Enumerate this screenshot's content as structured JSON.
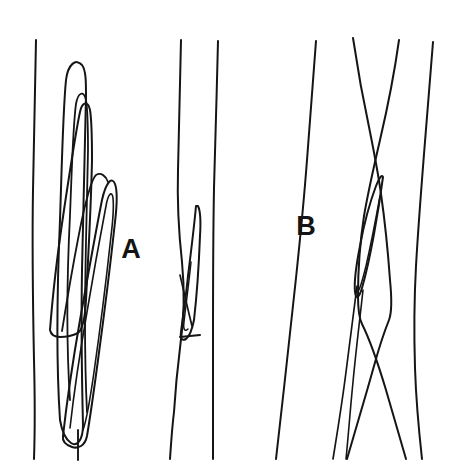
{
  "figure": {
    "background_color": "#ffffff",
    "ink_color": "#151515",
    "width": 465,
    "height": 476,
    "labels": [
      {
        "id": "label-a",
        "text": "A",
        "x": 131,
        "y": 258,
        "font_size": 27
      },
      {
        "id": "label-b",
        "text": "B",
        "x": 306,
        "y": 235,
        "font_size": 27
      }
    ],
    "groups": [
      {
        "id": "group-left",
        "name": "left-fibre-bundle",
        "label": "A",
        "description": "Vertical fibres with elongated overlapping loops"
      },
      {
        "id": "group-middle",
        "name": "middle-fibre-pair",
        "label": "A",
        "description": "Two near vertical fibres with a diagonal splice and a short horizontal tick"
      },
      {
        "id": "group-right",
        "name": "right-crossing-fibres",
        "label": "B",
        "description": "Four fibres crossing in an X with a narrow pointed loop"
      }
    ],
    "strokes": [
      {
        "name": "left-outer-fibre",
        "group": "group-left",
        "width": 2.0,
        "d": "M 36,40 C 35,90 34,140 33,190 C 32,250 33,310 34,360 C 35,400 35,430 34,459"
      },
      {
        "name": "left-long-loop-outer",
        "group": "group-left",
        "width": 2.0,
        "d": "M 60,420 C 56,360 57,290 60,220 C 62,160 63,110 66,80 C 68,64 76,58 82,65 C 86,70 86,82 86,96 C 85,150 83,210 82,270 C 81,330 82,385 83,425 C 83,440 77,447 71,443 C 65,439 62,432 60,420 Z"
      },
      {
        "name": "left-long-loop-inner",
        "group": "group-left",
        "width": 1.8,
        "d": "M 70,400 C 66,340 67,275 70,215 C 72,165 73,125 76,104 C 78,92 84,90 86,100 C 88,112 88,130 88,150 C 87,205 85,265 85,320 C 85,360 86,392 87,412"
      },
      {
        "name": "left-second-loop-outer",
        "group": "group-left",
        "width": 2.0,
        "d": "M 50,330 C 53,290 58,250 64,210 C 70,170 76,130 80,112 C 82,102 88,100 90,110 C 92,122 92,140 92,160 C 91,210 88,260 86,300 C 85,318 82,330 78,333 C 72,336 66,337 60,337 C 55,337 51,335 50,330 Z"
      },
      {
        "name": "left-third-blade-outer",
        "group": "group-left",
        "width": 2.0,
        "d": "M 63,436 C 67,400 73,360 80,320 C 88,275 96,230 102,200 C 106,182 112,176 115,184 C 118,192 117,205 115,222 C 110,268 104,316 98,360 C 94,390 90,418 87,436 C 85,446 78,449 72,447 C 66,445 62,442 63,436 Z"
      },
      {
        "name": "left-third-blade-inner",
        "group": "group-left",
        "width": 1.6,
        "d": "M 70,428 C 74,392 80,352 87,312 C 94,270 101,232 106,206 C 108,194 112,190 113,198 C 114,208 113,220 111,236 C 106,282 100,330 94,372 C 90,400 86,422 83,430"
      },
      {
        "name": "left-blade-apex-spur",
        "group": "group-left",
        "width": 1.8,
        "d": "M 62,331 C 66,306 72,270 79,234 C 85,202 92,178 96,175 C 101,172 106,176 108,182"
      },
      {
        "name": "left-lower-tail",
        "group": "group-left",
        "width": 1.9,
        "d": "M 78,430 C 78,441 78,450 78,460"
      },
      {
        "name": "middle-left-fibre",
        "group": "group-middle",
        "width": 2.0,
        "d": "M 181,40 C 180,85 179,128 178,170 C 177,205 179,235 182,262 C 185,292 184,320 180,348 C 177,372 175,396 174,412 C 172,428 171,444 170,459"
      },
      {
        "name": "middle-right-fibre",
        "group": "group-middle",
        "width": 2.0,
        "d": "M 218,41 C 217,90 215,140 214,188 C 213,240 213,290 213,338 C 213,386 213,424 213,459"
      },
      {
        "name": "middle-splice-outer",
        "group": "group-middle",
        "width": 2.0,
        "d": "M 196,206 C 194,228 191,252 188,276 C 186,296 183,316 181,332 C 180,339 182,341 186,339 C 190,336 192,330 194,320 C 197,294 199,262 200,236 C 201,220 200,210 198,206 Z"
      },
      {
        "name": "middle-splice-inner",
        "group": "group-middle",
        "width": 1.5,
        "d": "M 191,262 C 189,282 186,304 184,322 C 183,330 185,332 188,329"
      },
      {
        "name": "middle-splice-diagonal",
        "group": "group-middle",
        "width": 1.7,
        "d": "M 180,275 C 184,292 188,310 192,326"
      },
      {
        "name": "middle-horizontal-tick",
        "group": "group-middle",
        "width": 2.0,
        "d": "M 180,337 L 200,335"
      },
      {
        "name": "right-outer-left-fibre",
        "group": "group-right",
        "width": 2.0,
        "d": "M 316,41 C 313,80 310,120 307,160 C 304,200 300,240 296,278 C 292,316 288,352 284,388 C 281,416 278,440 276,459"
      },
      {
        "name": "right-cross-a",
        "group": "group-right",
        "width": 2.0,
        "d": "M 353,38 C 358,72 364,104 370,132 C 374,152 378,172 381,194 C 385,222 388,252 390,280 C 392,300 392,312 389,320 C 385,330 380,344 374,366 C 365,398 355,432 347,459"
      },
      {
        "name": "right-cross-b",
        "group": "group-right",
        "width": 2.0,
        "d": "M 399,40 C 394,76 387,110 380,140 C 374,166 368,192 364,216 C 360,242 358,272 358,296 C 358,310 359,318 362,324 C 368,336 377,360 386,390 C 394,418 401,442 406,459"
      },
      {
        "name": "right-outer-right-fibre",
        "group": "group-right",
        "width": 2.0,
        "d": "M 433,42 C 430,80 427,118 424,154 C 421,192 418,230 416,266 C 414,302 414,336 415,368 C 416,398 419,432 422,459"
      },
      {
        "name": "right-pointed-loop-outer",
        "group": "group-right",
        "width": 2.0,
        "d": "M 383,177 C 381,192 378,212 374,234 C 370,256 366,274 362,288 C 359,298 356,300 355,292 C 354,282 356,266 360,246 C 364,224 370,202 376,186 C 379,178 382,174 383,177 Z"
      },
      {
        "name": "right-pointed-loop-inner",
        "group": "group-right",
        "width": 1.5,
        "d": "M 380,196 C 376,218 371,244 366,266 C 362,282 359,292 358,290"
      },
      {
        "name": "right-loop-tail-left",
        "group": "group-right",
        "width": 1.7,
        "d": "M 357,286 C 354,310 350,340 346,372 C 342,404 337,434 333,459"
      },
      {
        "name": "right-loop-tail-right",
        "group": "group-right",
        "width": 1.6,
        "d": "M 363,290 C 360,318 356,350 353,382 C 350,412 348,440 346,459"
      }
    ]
  }
}
